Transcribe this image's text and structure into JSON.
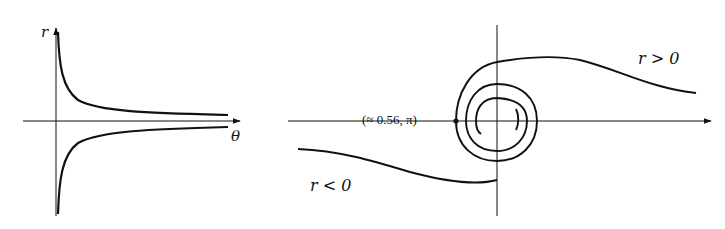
{
  "figures": [
    {
      "id": "left",
      "description": "Graph of r versus theta with hyperbolic branches approaching the theta axis",
      "axes": {
        "x_label": "θ",
        "y_label": "r"
      },
      "curves": [
        "upper branch r>0 decaying toward 0",
        "lower branch r<0 rising toward 0"
      ]
    },
    {
      "id": "right",
      "description": "Polar curve forming a spiral around the origin with two tails",
      "annotations": {
        "point_label": "(≈ 0.56, π)",
        "positive_label": "r > 0",
        "negative_label": "r < 0"
      }
    }
  ],
  "labels": {
    "r_axis": "r",
    "theta_axis": "θ",
    "point": "(≈ 0.56, π)",
    "r_pos": "r > 0",
    "r_neg": "r < 0"
  },
  "colors": {
    "stroke": "#111111",
    "background": "#ffffff"
  }
}
